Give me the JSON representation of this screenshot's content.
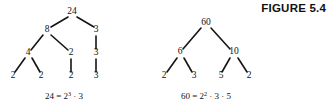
{
  "figure": {
    "label": "FIGURE 5.4"
  },
  "trees": [
    {
      "id": "factor-tree-24",
      "root_value": "24",
      "caption": {
        "lhs": "24 = 2",
        "exponent": "3",
        "rhs": " · 3",
        "full": "24 = 2³ · 3"
      },
      "nodes": [
        {
          "name": "node-24",
          "label": "24",
          "x": 72,
          "y": 14
        },
        {
          "name": "node-8",
          "label": "8",
          "x": 47,
          "y": 32
        },
        {
          "name": "node-3-a",
          "label": "3",
          "x": 96,
          "y": 32
        },
        {
          "name": "node-4",
          "label": "4",
          "x": 28,
          "y": 55
        },
        {
          "name": "node-2-a",
          "label": "2",
          "x": 71,
          "y": 55
        },
        {
          "name": "node-3-b",
          "label": "3",
          "x": 96,
          "y": 55
        },
        {
          "name": "node-2-b",
          "label": "2",
          "x": 13,
          "y": 78
        },
        {
          "name": "node-2-c",
          "label": "2",
          "x": 41,
          "y": 78
        },
        {
          "name": "node-2-d",
          "label": "2",
          "x": 71,
          "y": 78
        },
        {
          "name": "node-3-c",
          "label": "3",
          "x": 96,
          "y": 78
        }
      ],
      "edges": [
        {
          "name": "edge-24-8",
          "x1": 68,
          "y1": 17,
          "x2": 51,
          "y2": 27
        },
        {
          "name": "edge-24-3",
          "x1": 77,
          "y1": 17,
          "x2": 94,
          "y2": 27
        },
        {
          "name": "edge-8-4",
          "x1": 43,
          "y1": 35,
          "x2": 31,
          "y2": 50
        },
        {
          "name": "edge-8-2",
          "x1": 51,
          "y1": 35,
          "x2": 68,
          "y2": 50
        },
        {
          "name": "edge-3-3",
          "x1": 96,
          "y1": 36,
          "x2": 96,
          "y2": 49
        },
        {
          "name": "edge-4-2a",
          "x1": 25,
          "y1": 58,
          "x2": 15,
          "y2": 72
        },
        {
          "name": "edge-4-2b",
          "x1": 32,
          "y1": 58,
          "x2": 40,
          "y2": 72
        },
        {
          "name": "edge-2-2",
          "x1": 71,
          "y1": 59,
          "x2": 71,
          "y2": 72
        },
        {
          "name": "edge-3-3b",
          "x1": 96,
          "y1": 59,
          "x2": 96,
          "y2": 72
        }
      ],
      "caption_pos": {
        "x": 64,
        "y": 99
      }
    },
    {
      "id": "factor-tree-60",
      "root_value": "60",
      "caption": {
        "lhs": "60 = 2",
        "exponent": "2",
        "rhs": " · 3 · 5",
        "full": "60 = 2² · 3 · 5"
      },
      "nodes": [
        {
          "name": "node-60",
          "label": "60",
          "x": 206,
          "y": 25
        },
        {
          "name": "node-6",
          "label": "6",
          "x": 180,
          "y": 54
        },
        {
          "name": "node-10",
          "label": "10",
          "x": 234,
          "y": 54
        },
        {
          "name": "node-2-e",
          "label": "2",
          "x": 164,
          "y": 78
        },
        {
          "name": "node-3-d",
          "label": "3",
          "x": 194,
          "y": 78
        },
        {
          "name": "node-5",
          "label": "5",
          "x": 221,
          "y": 78
        },
        {
          "name": "node-2-f",
          "label": "2",
          "x": 249,
          "y": 78
        }
      ],
      "edges": [
        {
          "name": "edge-60-6",
          "x1": 201,
          "y1": 28,
          "x2": 183,
          "y2": 49
        },
        {
          "name": "edge-60-10",
          "x1": 211,
          "y1": 28,
          "x2": 230,
          "y2": 49
        },
        {
          "name": "edge-6-2",
          "x1": 177,
          "y1": 58,
          "x2": 167,
          "y2": 72
        },
        {
          "name": "edge-6-3",
          "x1": 184,
          "y1": 58,
          "x2": 192,
          "y2": 72
        },
        {
          "name": "edge-10-5",
          "x1": 230,
          "y1": 58,
          "x2": 222,
          "y2": 72
        },
        {
          "name": "edge-10-2",
          "x1": 238,
          "y1": 58,
          "x2": 247,
          "y2": 72
        }
      ],
      "caption_pos": {
        "x": 206,
        "y": 99
      }
    }
  ],
  "colors": {
    "ink": "#111111",
    "background": "#ffffff"
  }
}
